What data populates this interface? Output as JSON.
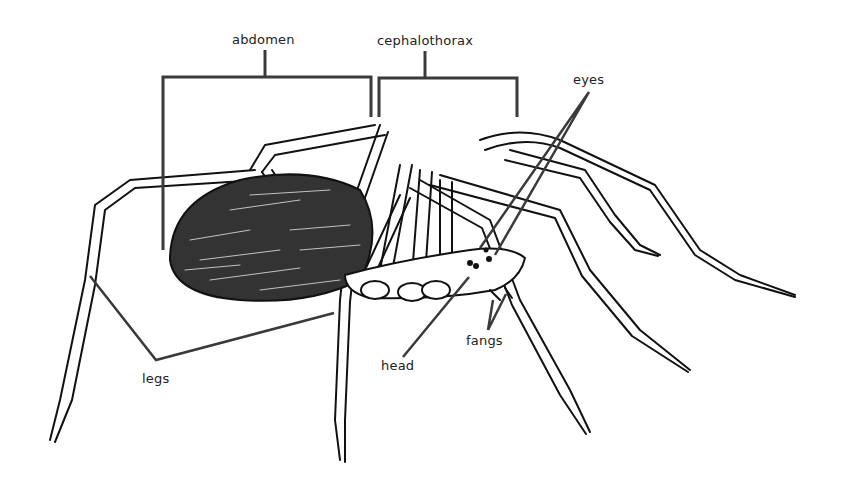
{
  "diagram": {
    "labels": {
      "abdomen": "abdomen",
      "cephalothorax": "cephalothorax",
      "eyes": "eyes",
      "head": "head",
      "fangs": "fangs",
      "legs": "legs"
    },
    "colors": {
      "leader_line": "#3a3a3a",
      "ink": "#111111",
      "background": "#ffffff"
    }
  }
}
